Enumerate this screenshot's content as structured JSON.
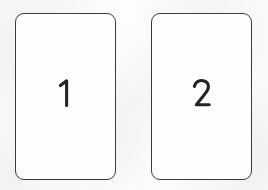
{
  "canvas": {
    "width": 268,
    "height": 190,
    "background_color": "#fcfcfc",
    "description": "Two blank rounded-rectangle cards side by side, each labeled with a handwritten numeral"
  },
  "style": {
    "card_border_color": "#3a3a3a",
    "card_fill_color": "#fefefe",
    "numeral_color": "#252525",
    "card_border_radius": "9px",
    "card_border_width": "1.3px"
  },
  "cards": [
    {
      "id": "card-1",
      "label": "1",
      "position": {
        "x": 15,
        "y": 13,
        "width": 101,
        "height": 167
      },
      "contents": ""
    },
    {
      "id": "card-2",
      "label": "2",
      "position": {
        "x": 151,
        "y": 13,
        "width": 101,
        "height": 167
      },
      "contents": ""
    }
  ]
}
